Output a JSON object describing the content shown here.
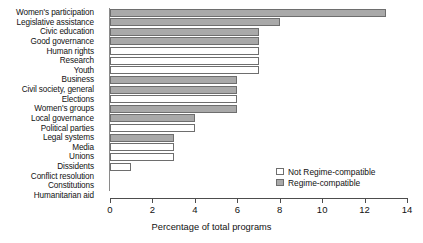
{
  "chart_data": {
    "type": "bar",
    "orientation": "horizontal",
    "title": "",
    "xlabel": "Percentage of total programs",
    "ylabel": "",
    "xlim": [
      0,
      14
    ],
    "xticks": [
      0,
      2,
      4,
      6,
      8,
      10,
      12,
      14
    ],
    "grid": false,
    "legend_position": "bottom-right",
    "categories": [
      "Women's participation",
      "Legislative assistance",
      "Civic education",
      "Good governance",
      "Human rights",
      "Research",
      "Youth",
      "Business",
      "Civil society, general",
      "Elections",
      "Women's groups",
      "Local governance",
      "Political parties",
      "Legal systems",
      "Media",
      "Unions",
      "Dissidents",
      "Conflict resolution",
      "Constitutions",
      "Humanitarian aid"
    ],
    "values": [
      13.0,
      8.0,
      7.0,
      7.0,
      7.0,
      7.0,
      7.0,
      6.0,
      6.0,
      6.0,
      6.0,
      4.0,
      4.0,
      3.0,
      3.0,
      3.0,
      1.0,
      0.0,
      0.0,
      0.0
    ],
    "groups": [
      "Regime-compatible",
      "Regime-compatible",
      "Regime-compatible",
      "Regime-compatible",
      "Not Regime-compatible",
      "Not Regime-compatible",
      "Not Regime-compatible",
      "Regime-compatible",
      "Regime-compatible",
      "Not Regime-compatible",
      "Regime-compatible",
      "Regime-compatible",
      "Not Regime-compatible",
      "Regime-compatible",
      "Not Regime-compatible",
      "Not Regime-compatible",
      "Not Regime-compatible",
      "Not Regime-compatible",
      "Not Regime-compatible",
      "Not Regime-compatible"
    ],
    "legend": [
      {
        "label": "Not Regime-compatible",
        "color": "#ffffff"
      },
      {
        "label": "Regime-compatible",
        "color": "#a9a9a9"
      }
    ]
  }
}
